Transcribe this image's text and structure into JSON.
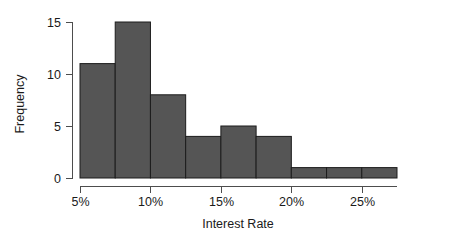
{
  "chart_data": {
    "type": "bar",
    "title": "",
    "subtitle": "",
    "xlabel": "Interest Rate",
    "ylabel": "Frequency",
    "categories": [
      "5%-7.5%",
      "7.5%-10%",
      "10%-12.5%",
      "12.5%-15%",
      "15%-17.5%",
      "17.5%-20%",
      "20%-22.5%",
      "22.5%-25%",
      "25%-27.5%"
    ],
    "bin_edges": [
      5,
      7.5,
      10,
      12.5,
      15,
      17.5,
      20,
      22.5,
      25,
      27.5
    ],
    "bin_width": 2.5,
    "values": [
      11,
      15,
      8,
      4,
      5,
      4,
      1,
      1,
      1
    ],
    "xlim": [
      5,
      27.5
    ],
    "ylim": [
      0,
      15
    ],
    "x_tick_values": [
      5,
      10,
      15,
      20,
      25
    ],
    "x_tick_labels": [
      "5%",
      "10%",
      "15%",
      "20%",
      "25%"
    ],
    "y_tick_values": [
      0,
      5,
      10,
      15
    ],
    "y_tick_labels": [
      "0",
      "5",
      "10",
      "15"
    ],
    "grid": false,
    "legend": false,
    "legend_position": "none",
    "bar_fill_color": "#555555",
    "bar_edge_color": "#1c1c1c",
    "axis_color": "#4d4d4d",
    "background_color": "#ffffff",
    "text_color": "#1a1a1a"
  },
  "labels": {
    "y_axis_title": "Frequency",
    "x_axis_title": "Interest Rate",
    "y_ticks": [
      "15",
      "10",
      "5",
      "0"
    ],
    "x_ticks": [
      "5%",
      "10%",
      "15%",
      "20%",
      "25%"
    ]
  }
}
